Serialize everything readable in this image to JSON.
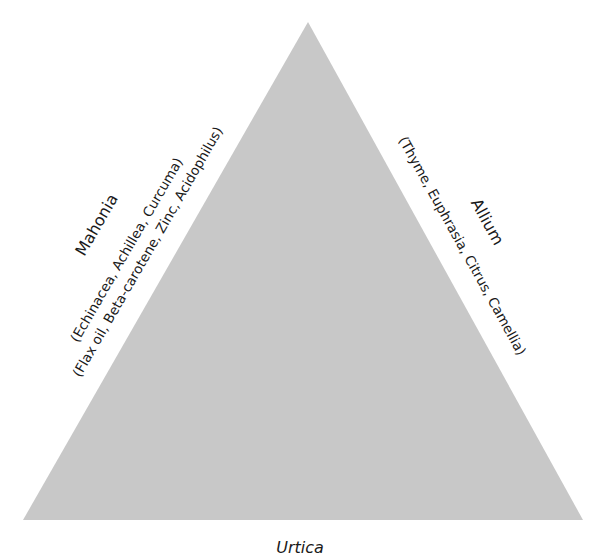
{
  "diagram": {
    "type": "triangle",
    "fill_color": "#c8c8c8",
    "background": "#ffffff",
    "vertices": {
      "apex": [
        308,
        22
      ],
      "bottom_left": [
        23,
        520
      ],
      "bottom_right": [
        583,
        520
      ]
    },
    "left_side": {
      "title": "Mahonia",
      "line1": "(Echinacea, Achillea, Curcuma)",
      "line2": "(Flax oil, Beta-carotene, Zinc, Acidophilus)"
    },
    "right_side": {
      "title": "Allium",
      "line1": "(Thyme, Euphrasia, Citrus, Camellia)"
    },
    "bottom_side": {
      "title": "Urtica"
    }
  }
}
